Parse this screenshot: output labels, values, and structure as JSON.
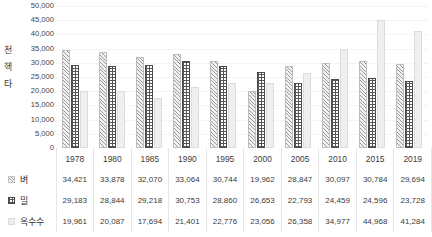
{
  "axis_unit_chars": [
    "천",
    "헥",
    "타"
  ],
  "chart_data": {
    "type": "bar",
    "title": "",
    "xlabel": "",
    "ylabel": "천 헥타",
    "ylim": [
      0,
      50000
    ],
    "ytick_labels": [
      "50,000",
      "45,000",
      "40,000",
      "35,000",
      "30,000",
      "25,000",
      "20,000",
      "15,000",
      "10,000",
      "5,000",
      "0"
    ],
    "ytick_values": [
      50000,
      45000,
      40000,
      35000,
      30000,
      25000,
      20000,
      15000,
      10000,
      5000,
      0
    ],
    "grid": true,
    "legend_position": "row-labels",
    "categories": [
      "1978",
      "1980",
      "1985",
      "1990",
      "1995",
      "2000",
      "2005",
      "2010",
      "2015",
      "2019"
    ],
    "series": [
      {
        "name": "벼",
        "pattern": "diagonal-hatch",
        "values": [
          34421,
          33878,
          32070,
          33064,
          30744,
          19962,
          28847,
          30097,
          30784,
          29694
        ],
        "labels": [
          "34,421",
          "33,878",
          "32,070",
          "33,064",
          "30,744",
          "19,962",
          "28,847",
          "30,097",
          "30,784",
          "29,694"
        ]
      },
      {
        "name": "밀",
        "pattern": "checker-grid",
        "values": [
          29183,
          28844,
          29218,
          30753,
          28860,
          26653,
          22793,
          24459,
          24596,
          23728
        ],
        "labels": [
          "29,183",
          "28,844",
          "29,218",
          "30,753",
          "28,860",
          "26,653",
          "22,793",
          "24,459",
          "24,596",
          "23,728"
        ]
      },
      {
        "name": "옥수수",
        "pattern": "fine-dots",
        "values": [
          19961,
          20087,
          17694,
          21401,
          22776,
          23056,
          26358,
          34977,
          44968,
          41284
        ],
        "labels": [
          "19,961",
          "20,087",
          "17,694",
          "21,401",
          "22,776",
          "23,056",
          "26,358",
          "34,977",
          "44,968",
          "41,284"
        ]
      }
    ]
  }
}
